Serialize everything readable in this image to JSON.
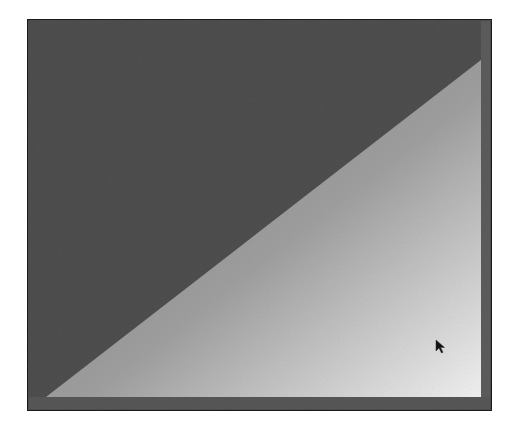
{
  "scene": {
    "background_color": "#ffffff",
    "frame": {
      "x": 27,
      "y": 19,
      "width": 465,
      "height": 392,
      "border_color": "#1a1a1a",
      "border_width": 2,
      "fill_color": "#4e4e4e",
      "inner_margin_color": "#5a5a5a"
    },
    "triangle": {
      "points": [
        [
          46,
          397
        ],
        [
          481,
          60
        ],
        [
          481,
          397
        ]
      ],
      "gradient_start_color": "#7a7a7a",
      "gradient_mid_color": "#a0a0a0",
      "gradient_end_color": "#f2f2f2"
    },
    "bottom_strip": {
      "x": 29,
      "y": 397,
      "width": 461,
      "height": 12,
      "color": "#575757"
    },
    "right_strip": {
      "x": 481,
      "y": 21,
      "width": 9,
      "height": 388,
      "color": "#5c5c5c"
    },
    "cursor": {
      "icon": "arrow-pointer-icon",
      "x": 436,
      "y": 340,
      "color": "#111111"
    }
  }
}
